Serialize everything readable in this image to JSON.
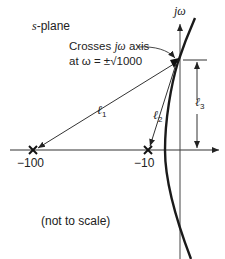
{
  "diagram": {
    "title_prefix": "s",
    "title_suffix": "-plane",
    "axis_label_j": "j",
    "axis_label_omega": "ω",
    "annotation": {
      "line1_prefix": "Crosses ",
      "line1_j": "j",
      "line1_omega": "ω",
      "line1_suffix": " axis",
      "line2": "at ω = ±√1000"
    },
    "vectors": [
      {
        "label": "ℓ",
        "subscript": "1",
        "from": "-100"
      },
      {
        "label": "ℓ",
        "subscript": "2",
        "from": "-10"
      },
      {
        "label": "ℓ",
        "subscript": "3",
        "from": "real axis"
      }
    ],
    "poles": [
      {
        "label": "−100",
        "value": -100
      },
      {
        "label": "−10",
        "value": -10
      }
    ],
    "note": "(not to scale)",
    "colors": {
      "line": "#222222",
      "background": "#ffffff"
    }
  }
}
